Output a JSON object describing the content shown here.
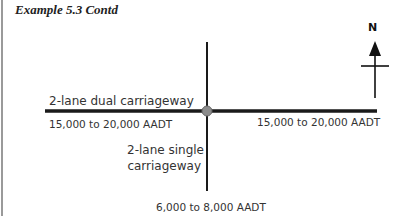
{
  "title": "Example 5.3 Contd",
  "compass": {
    "label": "N"
  },
  "roads": {
    "main": {
      "type_label": "2-lane dual carriageway",
      "west_flow": "15,000 to 20,000 AADT",
      "east_flow": "15,000 to 20,000 AADT"
    },
    "minor": {
      "type_label_line1": "2-lane single",
      "type_label_line2": "carriageway",
      "south_flow": "6,000 to 8,000 AADT"
    }
  },
  "colors": {
    "road": "#1a1a1a",
    "junction": "#8c8c8c"
  }
}
